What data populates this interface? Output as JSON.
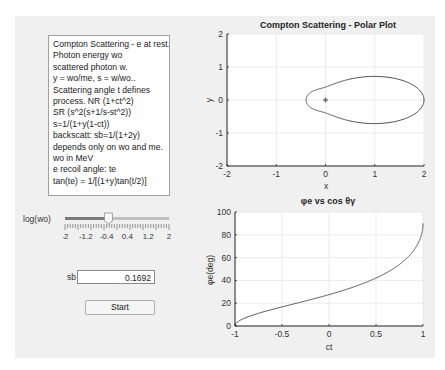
{
  "info_text": {
    "lines": [
      "Compton Scattering - e at rest.",
      "Photon energy wo",
      "scattered photon w.",
      "y = wo/me, s = w/wo..",
      "Scattering angle t defines",
      "process. NR (1+ct^2)",
      "SR (s^2(s+1/s-st^2))",
      "s=1/(1+y(1-ct))",
      "backscatt: sb=1/(1+2y)",
      "depends only on wo and me.",
      "wo in MeV",
      "e recoil angle: te",
      "tan(te) = 1/[(1+y)tan(t/2)]"
    ]
  },
  "slider": {
    "label": "log(wo)",
    "min": -2,
    "max": 2,
    "value": -0.33,
    "tick_labels": [
      "-2",
      "-1.2",
      "-0.4",
      "0.4",
      "1.2",
      "2"
    ]
  },
  "sb_field": {
    "label": "sb",
    "value": "0.1692"
  },
  "start_button": {
    "label": "Start"
  },
  "colors": {
    "curve": "#4d4d4d",
    "grid": "#e6e6e6",
    "axis": "#262626",
    "panel_bg": "#f0f0f0"
  },
  "chart_data": [
    {
      "type": "line",
      "title": "Compton Scattering - Polar Plot",
      "xlabel": "x",
      "ylabel": "y",
      "xlim": [
        -2,
        2
      ],
      "ylim": [
        -2,
        2
      ],
      "xticks": [
        "-2",
        "-1",
        "0",
        "1",
        "2"
      ],
      "yticks": [
        "-2",
        "-1",
        "0",
        "1",
        "2"
      ],
      "grid": true,
      "y_param": 0.92,
      "description": "Closed polar lobe r(t)=s^2(s+1/s-sin^2 t), s=1/(1+y(1-cos t)); spans x from about -0.38 to 2, |y| max about 0.75; marker at origin",
      "origin_marker": [
        0,
        0
      ]
    },
    {
      "type": "line",
      "title": "φe vs cos θγ",
      "xlabel": "ct",
      "ylabel": "φe(deg)",
      "xlim": [
        -1,
        1
      ],
      "ylim": [
        0,
        100
      ],
      "xticks": [
        "-1",
        "-0.5",
        "0",
        "0.5",
        "1"
      ],
      "yticks": [
        "0",
        "20",
        "40",
        "60",
        "80",
        "100"
      ],
      "grid": true,
      "y_param": 0.92,
      "x": [
        -1,
        -0.9,
        -0.75,
        -0.5,
        -0.25,
        0,
        0.25,
        0.5,
        0.75,
        0.9,
        0.97,
        1
      ],
      "values": [
        0,
        7.1,
        11.5,
        16.7,
        21.6,
        27.5,
        33.6,
        41.8,
        54.9,
        67.7,
        78.7,
        90
      ]
    }
  ]
}
